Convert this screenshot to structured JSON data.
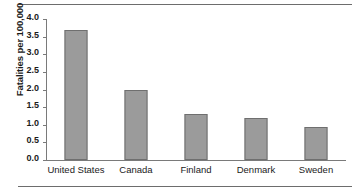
{
  "chart_data": {
    "type": "bar",
    "title": "",
    "xlabel": "",
    "ylabel": "Fatalities per 100,000",
    "categories": [
      "United States",
      "Canada",
      "Finland",
      "Denmark",
      "Sweden"
    ],
    "values": [
      3.68,
      2.0,
      1.3,
      1.2,
      0.95
    ],
    "ylim": [
      0.0,
      4.0
    ],
    "yticks": [
      "0.0",
      "0.5",
      "1.0",
      "1.5",
      "2.0",
      "2.5",
      "3.0",
      "3.5",
      "4.0"
    ],
    "ytick_values": [
      0.0,
      0.5,
      1.0,
      1.5,
      2.0,
      2.5,
      3.0,
      3.5,
      4.0
    ],
    "grid": false,
    "legend": null,
    "bar_color": "#9b9b9b",
    "bar_edge_color": "#6f6f6f",
    "axis_color": "#7a7a7a",
    "text_color": "#1b1b1b"
  }
}
